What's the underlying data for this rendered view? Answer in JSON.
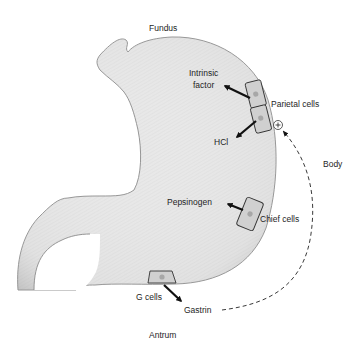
{
  "diagram": {
    "regions": {
      "fundus": "Fundus",
      "body": "Body",
      "antrum": "Antrum"
    },
    "cells": {
      "parietal": "Parietal cells",
      "chief": "Chief cells",
      "g": "G cells"
    },
    "secretions": {
      "intrinsic_factor_line1": "Intrinsic",
      "intrinsic_factor_line2": "factor",
      "hcl": "HCl",
      "pepsinogen": "Pepsinogen",
      "gastrin": "Gastrin"
    },
    "feedback": {
      "symbol": "+",
      "description": "Gastrin stimulates parietal cells"
    },
    "colors": {
      "stomach_fill": "#e6e6e6",
      "stomach_edge": "#8a8a8a",
      "cell_fill": "#cfcfcf",
      "nucleus": "#a9a9a9",
      "arrow": "#111111"
    }
  }
}
